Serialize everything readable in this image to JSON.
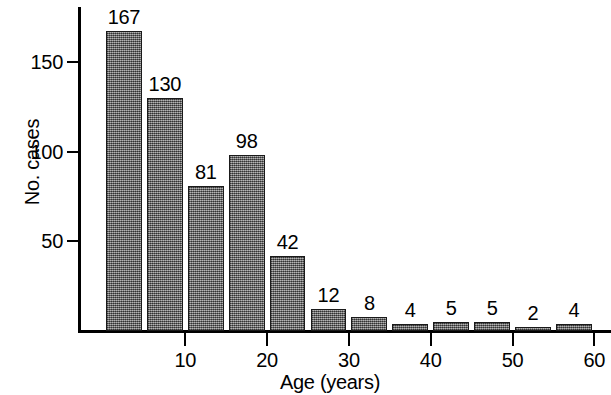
{
  "chart_data": {
    "type": "bar",
    "title": "",
    "xlabel": "Age (years)",
    "ylabel": "No. cases",
    "categories": [
      "0-4",
      "5-9",
      "10-14",
      "15-19",
      "20-24",
      "25-29",
      "30-34",
      "35-39",
      "40-44",
      "45-49",
      "50-54",
      "55-59"
    ],
    "bin_starts": [
      0,
      5,
      10,
      15,
      20,
      25,
      30,
      35,
      40,
      45,
      50,
      55
    ],
    "bin_width": 5,
    "values": [
      167,
      130,
      81,
      98,
      42,
      12,
      8,
      4,
      5,
      5,
      2,
      4
    ],
    "data_labels": [
      "167",
      "130",
      "81",
      "98",
      "42",
      "12",
      "8",
      "4",
      "5",
      "5",
      "2",
      "4"
    ],
    "xlim": [
      0,
      62
    ],
    "ylim": [
      0,
      182
    ],
    "x_ticks": [
      10,
      20,
      30,
      40,
      50,
      60
    ],
    "x_tick_labels": [
      "10",
      "20",
      "30",
      "40",
      "50",
      "60"
    ],
    "y_ticks": [
      50,
      100,
      150
    ],
    "y_tick_labels": [
      "50",
      "100",
      "150"
    ],
    "grid": false,
    "legend": false,
    "bar_fill_color": "#6e6e6e",
    "bar_edge_color": "#1a1a1a",
    "axis_color": "#000000",
    "background_color": "#ffffff"
  }
}
